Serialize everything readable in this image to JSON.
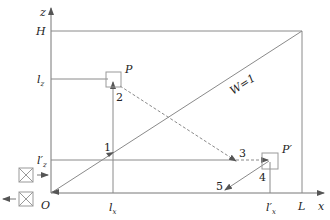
{
  "diagram": {
    "axes": {
      "x_label": "x",
      "z_label": "z",
      "origin_label": "O"
    },
    "z_ticks": {
      "H": "H",
      "lz": "l",
      "lz_sub": "z",
      "lz_prime": "l′",
      "lz_prime_sub": "z"
    },
    "x_ticks": {
      "lx": "l",
      "lx_sub": "x",
      "lx_prime": "l′",
      "lx_prime_sub": "x",
      "L": "L"
    },
    "points": {
      "P": "P",
      "P_prime": "P′"
    },
    "diagonal_label": "W=1",
    "step_labels": [
      "1",
      "2",
      "3",
      "4",
      "5"
    ],
    "colors": {
      "line": "#8a8a8a",
      "text": "#222222",
      "box": "#9a9a9a"
    }
  }
}
